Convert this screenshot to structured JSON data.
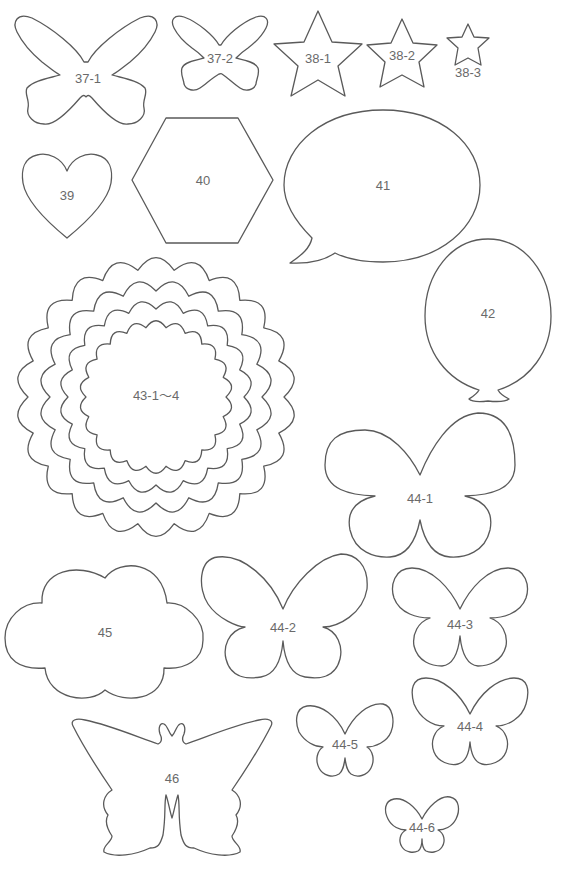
{
  "sheet": {
    "title": "Felt craft cut-out templates",
    "stroke_color": "#5a5a5a",
    "label_color": "#6a6a6a",
    "background": "#ffffff"
  },
  "shapes": [
    {
      "id": "37-1",
      "label": "37-1",
      "type": "butterfly-scalloped",
      "x": 80,
      "y": 80
    },
    {
      "id": "37-2",
      "label": "37-2",
      "type": "butterfly-scalloped",
      "x": 220,
      "y": 59
    },
    {
      "id": "38-1",
      "label": "38-1",
      "type": "star",
      "x": 318,
      "y": 60
    },
    {
      "id": "38-2",
      "label": "38-2",
      "type": "star",
      "x": 402,
      "y": 56
    },
    {
      "id": "38-3",
      "label": "38-3",
      "type": "star",
      "x": 468,
      "y": 74
    },
    {
      "id": "39",
      "label": "39",
      "type": "heart",
      "x": 67,
      "y": 196
    },
    {
      "id": "40",
      "label": "40",
      "type": "hexagon",
      "x": 203,
      "y": 182
    },
    {
      "id": "41",
      "label": "41",
      "type": "speech-bubble",
      "x": 382,
      "y": 187
    },
    {
      "id": "42",
      "label": "42",
      "type": "balloon",
      "x": 488,
      "y": 315
    },
    {
      "id": "43",
      "label": "43-1～4",
      "type": "scalloped-circles",
      "x": 156,
      "y": 397
    },
    {
      "id": "44-1",
      "label": "44-1",
      "type": "butterfly",
      "x": 420,
      "y": 500
    },
    {
      "id": "45",
      "label": "45",
      "type": "cloud",
      "x": 105,
      "y": 634
    },
    {
      "id": "44-2",
      "label": "44-2",
      "type": "butterfly",
      "x": 283,
      "y": 629
    },
    {
      "id": "44-3",
      "label": "44-3",
      "type": "butterfly",
      "x": 460,
      "y": 626
    },
    {
      "id": "44-4",
      "label": "44-4",
      "type": "butterfly",
      "x": 470,
      "y": 728
    },
    {
      "id": "46",
      "label": "46",
      "type": "swallowtail-butterfly",
      "x": 172,
      "y": 780
    },
    {
      "id": "44-5",
      "label": "44-5",
      "type": "butterfly",
      "x": 345,
      "y": 746
    },
    {
      "id": "44-6",
      "label": "44-6",
      "type": "butterfly",
      "x": 422,
      "y": 829
    }
  ]
}
